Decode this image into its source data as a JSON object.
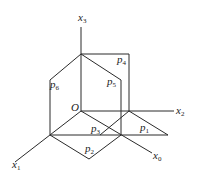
{
  "diagram": {
    "type": "geometric-projection",
    "origin": {
      "label": "O"
    },
    "axes": [
      {
        "name": "x3",
        "base": "x",
        "sub": "3"
      },
      {
        "name": "x2",
        "base": "x",
        "sub": "2"
      },
      {
        "name": "x1",
        "base": "x",
        "sub": "1"
      },
      {
        "name": "x0",
        "base": "x",
        "sub": "0"
      }
    ],
    "planes": [
      {
        "name": "p1",
        "base": "p",
        "sub": "1"
      },
      {
        "name": "p2",
        "base": "p",
        "sub": "2"
      },
      {
        "name": "p3",
        "base": "p",
        "sub": "3"
      },
      {
        "name": "p4",
        "base": "p",
        "sub": "4"
      },
      {
        "name": "p5",
        "base": "p",
        "sub": "5"
      },
      {
        "name": "p6",
        "base": "p",
        "sub": "6"
      }
    ],
    "colors": {
      "line": "#2a2a2a",
      "background": "#ffffff"
    }
  }
}
